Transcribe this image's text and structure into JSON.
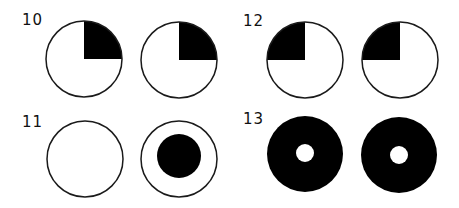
{
  "figures": [
    {
      "label": "10",
      "description": "two circles, top-right quadrant filled black"
    },
    {
      "label": "11",
      "description": "empty circle; circle with centered black disc"
    },
    {
      "label": "12",
      "description": "two circles, top-left quadrant filled black"
    },
    {
      "label": "13",
      "description": "two black discs with small white center holes"
    }
  ],
  "colors": {
    "fill": "#000000",
    "stroke": "#1a1a1a",
    "background": "#ffffff"
  }
}
